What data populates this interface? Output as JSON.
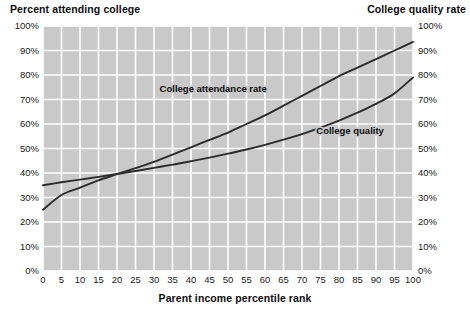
{
  "titles": {
    "left_axis_title": "Percent attending college",
    "right_axis_title": "College quality rate",
    "x_axis_title": "Parent income percentile rank"
  },
  "colors": {
    "plot_background": "#c9c9c9",
    "gridline": "#ffffff",
    "line": "#2b2b2b",
    "text": "#0d0d0d"
  },
  "chart_data": {
    "type": "line",
    "title": "",
    "xlabel": "Parent income percentile rank",
    "ylabel": "Percent attending college",
    "ylabel_right": "College quality rate",
    "xlim": [
      0,
      100
    ],
    "ylim": [
      0,
      100
    ],
    "grid": true,
    "legend_position": "inline-annotations",
    "xticks": [
      0,
      5,
      10,
      15,
      20,
      25,
      30,
      35,
      40,
      45,
      50,
      55,
      60,
      65,
      70,
      75,
      80,
      85,
      90,
      95,
      100
    ],
    "xticklabels": [
      "0",
      "5",
      "10",
      "15",
      "20",
      "25",
      "30",
      "35",
      "40",
      "45",
      "50",
      "55",
      "60",
      "65",
      "70",
      "75",
      "80",
      "85",
      "90",
      "95",
      "100"
    ],
    "yticks": [
      0,
      10,
      20,
      30,
      40,
      50,
      60,
      70,
      80,
      90,
      100
    ],
    "yticklabels": [
      "0%",
      "10%",
      "20%",
      "30%",
      "40%",
      "50%",
      "60%",
      "70%",
      "80%",
      "90%",
      "100%"
    ],
    "yticklabels_right": [
      "0%",
      "10%",
      "20%",
      "30%",
      "40%",
      "50%",
      "60%",
      "70%",
      "80%",
      "90%",
      "100%"
    ],
    "x": [
      0,
      5,
      10,
      15,
      20,
      25,
      30,
      35,
      40,
      45,
      50,
      55,
      60,
      65,
      70,
      75,
      80,
      85,
      90,
      95,
      100
    ],
    "series": [
      {
        "name": "College attendance rate",
        "label": "College attendance rate",
        "label_x": 46,
        "label_y": 73,
        "values": [
          25.0,
          31.0,
          34.0,
          37.0,
          39.5,
          42.0,
          44.5,
          47.5,
          50.5,
          53.5,
          56.5,
          60.0,
          63.5,
          67.5,
          71.5,
          75.5,
          79.5,
          83.0,
          86.5,
          90.0,
          93.5
        ]
      },
      {
        "name": "College quality",
        "label": "College quality",
        "label_x": 83,
        "label_y": 56,
        "values": [
          35.0,
          36.2,
          37.3,
          38.4,
          39.6,
          40.8,
          42.1,
          43.4,
          44.8,
          46.3,
          47.9,
          49.6,
          51.5,
          53.6,
          55.9,
          58.5,
          61.4,
          64.6,
          68.2,
          72.5,
          79.0
        ]
      }
    ],
    "annotations": [
      {
        "text": "College attendance rate",
        "x": 46,
        "y": 73
      },
      {
        "text": "College quality",
        "x": 83,
        "y": 56
      }
    ]
  }
}
